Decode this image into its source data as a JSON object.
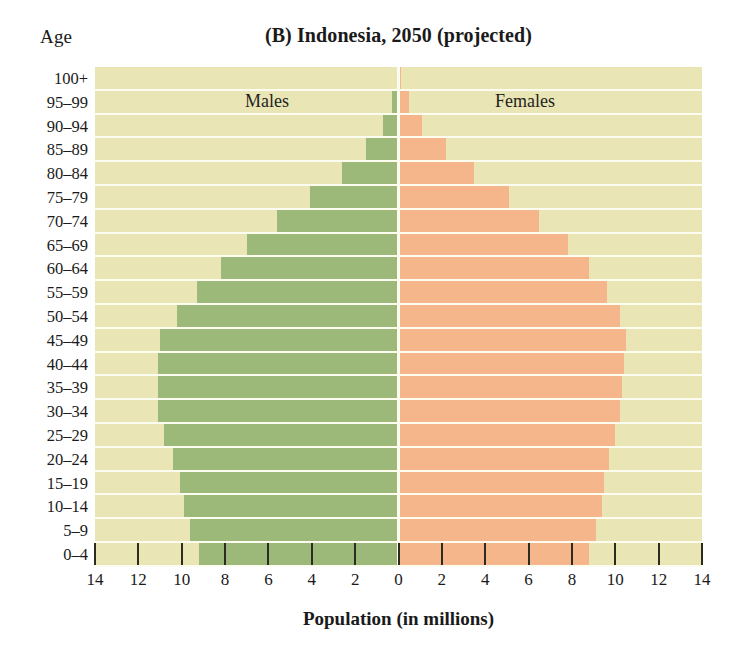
{
  "chart_data": {
    "type": "bar",
    "subtype": "population-pyramid",
    "title": "(B) Indonesia, 2050 (projected)",
    "xlabel": "Population (in millions)",
    "ylabel": "Age",
    "xlim": [
      -14,
      14
    ],
    "xticks": [
      14,
      12,
      10,
      8,
      6,
      4,
      2,
      0,
      2,
      4,
      6,
      8,
      10,
      12,
      14
    ],
    "xtick_values": [
      -14,
      -12,
      -10,
      -8,
      -6,
      -4,
      -2,
      0,
      2,
      4,
      6,
      8,
      10,
      12,
      14
    ],
    "grid": false,
    "legend_position": "inside-top",
    "categories": [
      "100+",
      "95–99",
      "90–94",
      "85–89",
      "80–84",
      "75–79",
      "70–74",
      "65–69",
      "60–64",
      "55–59",
      "50–54",
      "45–49",
      "40–44",
      "35–39",
      "30–34",
      "25–29",
      "20–24",
      "15–19",
      "10–14",
      "5–9",
      "0–4"
    ],
    "series": [
      {
        "name": "Males",
        "color": "#9db979",
        "side": "left",
        "values": [
          0.05,
          0.3,
          0.7,
          1.5,
          2.6,
          4.1,
          5.6,
          7.0,
          8.2,
          9.3,
          10.2,
          11.0,
          11.1,
          11.1,
          11.1,
          10.8,
          10.4,
          10.1,
          9.9,
          9.6,
          9.2
        ]
      },
      {
        "name": "Females",
        "color": "#f5b68b",
        "side": "right",
        "values": [
          0.1,
          0.5,
          1.1,
          2.2,
          3.5,
          5.1,
          6.5,
          7.8,
          8.8,
          9.6,
          10.2,
          10.5,
          10.4,
          10.3,
          10.2,
          10.0,
          9.7,
          9.5,
          9.4,
          9.1,
          8.8
        ]
      }
    ]
  },
  "labels": {
    "age_axis_title": "Age",
    "males": "Males",
    "females": "Females"
  },
  "colors": {
    "male_bar": "#9db979",
    "female_bar": "#f5b68b",
    "plot_background": "#e9e5b4",
    "row_separator": "#fdfcf0",
    "axis_text": "#1a1a1a"
  }
}
